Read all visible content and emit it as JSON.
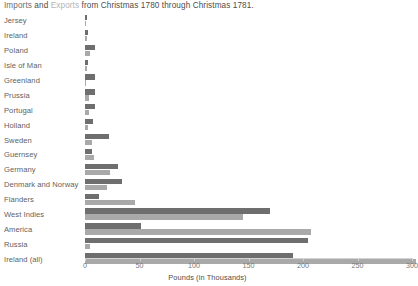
{
  "title": {
    "segment_imports": "Imports",
    "segment_and": " and ",
    "segment_exports": "Exports",
    "segment_tail": " from Christmas 1780 through Christmas 1781."
  },
  "colors": {
    "imports": "#6e6e6e",
    "exports": "#a9a9a9",
    "axis": "#d4d4d4",
    "text": "#5f5f5f",
    "background": "#ffffff"
  },
  "axis": {
    "title": "Pounds (in Thousands)",
    "ticks": [
      0,
      50,
      100,
      150,
      200,
      250,
      300
    ],
    "tick_labels": [
      "0",
      "50",
      "100",
      "150",
      "200",
      "250",
      "300"
    ]
  },
  "chart_data": {
    "type": "bar",
    "orientation": "horizontal",
    "title": "Imports and Exports from Christmas 1780 through Christmas 1781.",
    "xlabel": "Pounds (in Thousands)",
    "ylabel": "",
    "xlim": [
      0,
      300
    ],
    "grid": false,
    "legend": [
      "Imports",
      "Exports"
    ],
    "legend_position": "title",
    "categories": [
      "Jersey",
      "Ireland",
      "Poland",
      "Isle of Man",
      "Greenland",
      "Prussia",
      "Portugal",
      "Holland",
      "Sweden",
      "Guernsey",
      "Germany",
      "Denmark and Norway",
      "Flanders",
      "West Indies",
      "America",
      "Russia",
      "Ireland (all)"
    ],
    "series": [
      {
        "name": "Imports",
        "color": "#6e6e6e",
        "values": [
          2,
          3,
          9,
          3,
          9,
          9,
          9,
          7,
          22,
          6,
          30,
          34,
          13,
          170,
          51,
          205,
          191
        ]
      },
      {
        "name": "Exports",
        "color": "#a9a9a9",
        "values": [
          1,
          2,
          5,
          2,
          1,
          4,
          4,
          3,
          6,
          8,
          23,
          20,
          46,
          145,
          207,
          5,
          304
        ]
      }
    ]
  }
}
